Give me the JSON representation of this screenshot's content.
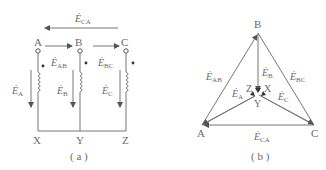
{
  "figure_a": {
    "caption": "( a )",
    "top_nodes": [
      "A",
      "B",
      "C"
    ],
    "bottom_nodes": [
      "X",
      "Y",
      "Z"
    ],
    "arrows": {
      "e_ca": {
        "base": "Ė",
        "sub": "CA"
      },
      "e_ab": {
        "base": "Ė",
        "sub": "AB"
      },
      "e_bc": {
        "base": "Ė",
        "sub": "BC"
      },
      "e_a": {
        "base": "Ė",
        "sub": "A"
      },
      "e_b": {
        "base": "Ė",
        "sub": "B"
      },
      "e_c": {
        "base": "Ė",
        "sub": "C"
      }
    }
  },
  "figure_b": {
    "caption": "( b )",
    "vertices": {
      "top": "B",
      "left": "A",
      "right": "C"
    },
    "center": {
      "z": "Z",
      "x": "X",
      "y": "Y"
    },
    "arrows": {
      "e_ab": {
        "base": "Ė",
        "sub": "AB"
      },
      "e_bc": {
        "base": "Ė",
        "sub": "BC"
      },
      "e_ca": {
        "base": "Ė",
        "sub": "CA"
      },
      "e_a": {
        "base": "Ė",
        "sub": "A"
      },
      "e_b": {
        "base": "Ė",
        "sub": "B"
      },
      "e_c": {
        "base": "Ė",
        "sub": "C"
      }
    }
  }
}
